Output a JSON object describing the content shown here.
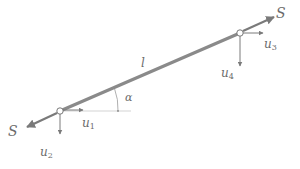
{
  "diagram": {
    "type": "truss-bar-element",
    "colors": {
      "bar": "#8a8a8a",
      "arrow": "#7a7a7a",
      "text": "#6b6b6b",
      "reference_line": "#c8c8c8",
      "node_fill": "#ffffff"
    },
    "bar": {
      "label": "l",
      "start_node": {
        "x": 60,
        "y": 111
      },
      "end_node": {
        "x": 240,
        "y": 33
      }
    },
    "angle": {
      "label": "α"
    },
    "forces": {
      "left": {
        "label": "S"
      },
      "right": {
        "label": "S"
      }
    },
    "displacements": [
      {
        "base": "u",
        "sub": "1",
        "node": "left",
        "direction": "horizontal"
      },
      {
        "base": "u",
        "sub": "2",
        "node": "left",
        "direction": "vertical"
      },
      {
        "base": "u",
        "sub": "3",
        "node": "right",
        "direction": "horizontal"
      },
      {
        "base": "u",
        "sub": "4",
        "node": "right",
        "direction": "vertical"
      }
    ]
  }
}
